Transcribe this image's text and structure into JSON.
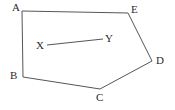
{
  "figure": {
    "background_color": "#ffffff",
    "stroke_color": "#555555",
    "label_color": "#2b2b2b",
    "stroke_width": 1,
    "canvas": {
      "width": 175,
      "height": 110
    }
  },
  "polygon": {
    "name": "pentagon-abcde",
    "closed": true,
    "vertices": [
      {
        "id": "A",
        "label": "A",
        "x": 22,
        "y": 11,
        "label_x": 12,
        "label_y": 2
      },
      {
        "id": "E",
        "label": "E",
        "x": 128,
        "y": 13,
        "label_x": 131,
        "label_y": 4
      },
      {
        "id": "D",
        "label": "D",
        "x": 152,
        "y": 61,
        "label_x": 156,
        "label_y": 55
      },
      {
        "id": "C",
        "label": "C",
        "x": 100,
        "y": 89,
        "label_x": 96,
        "label_y": 92
      },
      {
        "id": "B",
        "label": "B",
        "x": 23,
        "y": 77,
        "label_x": 10,
        "label_y": 70
      }
    ],
    "edges": [
      "A-E",
      "E-D",
      "D-C",
      "C-B",
      "B-A"
    ]
  },
  "segment": {
    "name": "segment-xy",
    "endpoints": [
      {
        "id": "X",
        "label": "X",
        "x": 47,
        "y": 45,
        "label_x": 36,
        "label_y": 40
      },
      {
        "id": "Y",
        "label": "Y",
        "x": 103,
        "y": 39,
        "label_x": 105,
        "label_y": 33
      }
    ]
  }
}
